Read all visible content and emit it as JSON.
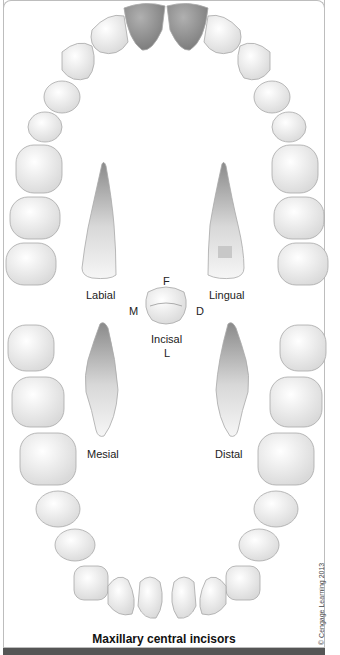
{
  "figure": {
    "caption": "Maxillary central incisors",
    "copyright": "© Cengage Learning 2013",
    "highlight_color": "#8c8c8c",
    "tooth_color": "#eeeeee"
  },
  "views": {
    "labial": "Labial",
    "lingual": "Lingual",
    "mesial": "Mesial",
    "distal": "Distal",
    "incisal": "Incisal"
  },
  "orientation": {
    "facial": "F",
    "mesial": "M",
    "distal": "D",
    "lingual": "L"
  },
  "arches": {
    "upper": {
      "highlighted": [
        "central incisor (left)",
        "central incisor (right)"
      ]
    },
    "lower": {
      "highlighted": []
    }
  }
}
